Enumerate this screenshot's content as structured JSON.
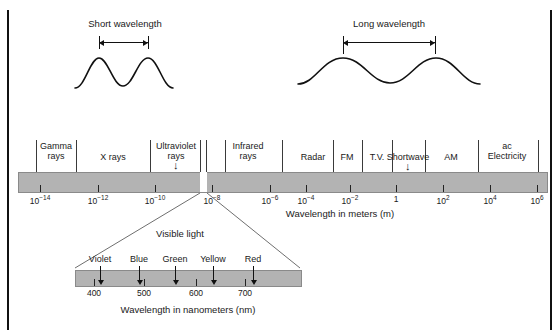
{
  "figure": {
    "bar_color": "#b3b3b3",
    "line_color": "#111111"
  },
  "waves": {
    "short": {
      "label": "Short wavelength",
      "peak_count": 2
    },
    "long": {
      "label": "Long wavelength",
      "peak_count": 2
    }
  },
  "spectrum": {
    "axis_caption": "Wavelength in meters (m)",
    "bands": [
      {
        "label_line1": "Gamma",
        "label_line2": "rays",
        "x": 56
      },
      {
        "label_line1": "X rays",
        "label_line2": "",
        "x": 113
      },
      {
        "label_line1": "Ultraviolet",
        "label_line2": "rays",
        "x": 176,
        "arrow": "↓"
      },
      {
        "label_line1": "Infrared",
        "label_line2": "rays",
        "x": 248
      },
      {
        "label_line1": "Radar",
        "label_line2": "",
        "x": 313
      },
      {
        "label_line1": "FM",
        "label_line2": "",
        "x": 347
      },
      {
        "label_line1": "T.V.",
        "label_line2": "",
        "x": 377
      },
      {
        "label_line1": "Shortwave",
        "label_line2": "",
        "x": 408,
        "arrow": "↓"
      },
      {
        "label_line1": "AM",
        "label_line2": "",
        "x": 451
      },
      {
        "label_line1": "ac",
        "label_line2": "Electricity",
        "x": 507
      }
    ],
    "dividers_x": [
      36,
      76,
      150,
      200,
      206,
      225,
      282,
      333,
      362,
      392,
      425,
      478,
      538
    ],
    "ticks": [
      {
        "mantissa": "10",
        "exponent": "−14",
        "x": 40
      },
      {
        "mantissa": "10",
        "exponent": "−12",
        "x": 98
      },
      {
        "mantissa": "10",
        "exponent": "−10",
        "x": 155
      },
      {
        "mantissa": "10",
        "exponent": "−8",
        "x": 212
      },
      {
        "mantissa": "10",
        "exponent": "−6",
        "x": 270
      },
      {
        "mantissa": "10",
        "exponent": "−4",
        "x": 306
      },
      {
        "mantissa": "10",
        "exponent": "−2",
        "x": 350
      },
      {
        "mantissa": "1",
        "exponent": "",
        "x": 396
      },
      {
        "mantissa": "10",
        "exponent": "2",
        "x": 443
      },
      {
        "mantissa": "10",
        "exponent": "4",
        "x": 490
      },
      {
        "mantissa": "10",
        "exponent": "6",
        "x": 537
      }
    ]
  },
  "visible_light": {
    "title": "Visible light",
    "axis_caption": "Wavelength in nanometers (nm)",
    "colors": [
      {
        "label": "Violet",
        "x": 100
      },
      {
        "label": "Blue",
        "x": 139
      },
      {
        "label": "Green",
        "x": 175
      },
      {
        "label": "Yellow",
        "x": 213
      },
      {
        "label": "Red",
        "x": 253
      }
    ],
    "ticks": [
      {
        "label": "400",
        "x": 94
      },
      {
        "label": "500",
        "x": 144
      },
      {
        "label": "600",
        "x": 196
      },
      {
        "label": "700",
        "x": 245
      }
    ]
  }
}
